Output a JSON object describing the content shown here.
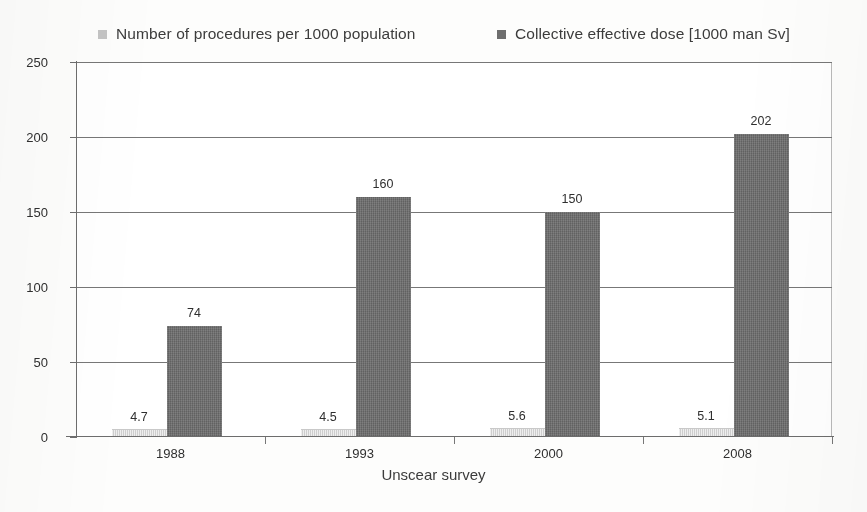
{
  "chart_data": {
    "type": "bar",
    "title": "",
    "subtitle": "",
    "xlabel": "Unscear survey",
    "ylabel": "",
    "categories": [
      "1988",
      "1993",
      "2000",
      "2008"
    ],
    "series": [
      {
        "name": "Number of procedures per 1000 population",
        "color": "#d9d9d9",
        "values": [
          4.7,
          4.5,
          5.6,
          5.1
        ],
        "labels": [
          "4.7",
          "4.5",
          "5.6",
          "5.1"
        ]
      },
      {
        "name": "Collective effective dose [1000 man Sv]",
        "color": "#6e6e6e",
        "values": [
          74,
          160,
          150,
          202
        ],
        "labels": [
          "74",
          "160",
          "150",
          "202"
        ]
      }
    ],
    "ylim": [
      0,
      250
    ],
    "ytick_values": [
      0,
      50,
      100,
      150,
      200,
      250
    ],
    "ytick_labels": [
      "0",
      "50",
      "100",
      "150",
      "200",
      "250"
    ],
    "grid": true,
    "legend_position": "top"
  },
  "legend": {
    "entries": [
      {
        "label": "Number of procedures per 1000 population",
        "color": "#c4c4c4"
      },
      {
        "label": "Collective effective dose [1000 man Sv]",
        "color": "#6e6e6e"
      }
    ]
  },
  "axis": {
    "x_title": "Unscear survey"
  }
}
